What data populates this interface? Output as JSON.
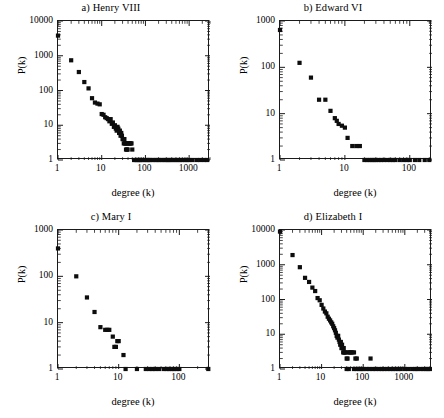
{
  "figure": {
    "panel_count": 4,
    "axis_labels": {
      "x": "degree (k)",
      "y": "P(k)"
    }
  },
  "chart_data": [
    {
      "type": "scatter",
      "title": "a) Henry VIII",
      "xlabel": "degree (k)",
      "ylabel": "P(k)",
      "xscale": "log",
      "yscale": "log",
      "xlim": [
        1,
        3000
      ],
      "ylim": [
        1,
        10000
      ],
      "xticks": [
        1,
        10,
        100,
        1000
      ],
      "xtick_labels": [
        "1",
        "10",
        "100",
        "1000"
      ],
      "yticks": [
        1,
        10,
        100,
        1000,
        10000
      ],
      "ytick_labels": [
        "1",
        "10",
        "100",
        "1000",
        "10000"
      ],
      "grid": false,
      "legend": "none",
      "x": [
        1,
        2,
        3,
        4,
        5,
        6,
        7,
        8,
        9,
        10,
        11,
        12,
        13,
        14,
        15,
        16,
        17,
        18,
        19,
        20,
        21,
        22,
        23,
        24,
        25,
        26,
        27,
        28,
        29,
        30,
        31,
        32,
        33,
        34,
        35,
        36,
        37,
        38,
        39,
        40,
        42,
        44,
        46,
        48,
        50,
        55,
        60,
        65,
        70,
        75,
        80,
        90,
        100,
        110,
        120,
        130,
        150,
        170,
        190,
        210,
        240,
        270,
        300,
        330,
        360,
        400,
        450,
        500,
        560,
        620,
        700,
        800,
        900,
        1000,
        1200,
        1500,
        1800,
        2200,
        2600
      ],
      "y": [
        3800,
        740,
        340,
        175,
        115,
        60,
        45,
        42,
        40,
        21,
        20,
        17,
        16,
        15,
        13,
        15,
        11,
        12,
        9,
        10,
        8,
        7,
        9,
        8,
        6,
        7,
        5,
        6,
        5,
        4,
        4,
        3,
        4,
        3,
        3,
        2,
        3,
        2,
        2,
        3,
        3,
        3,
        3,
        3,
        2,
        1,
        1,
        1,
        1,
        1,
        1,
        1,
        1,
        1,
        1,
        1,
        1,
        1,
        1,
        1,
        1,
        1,
        1,
        1,
        1,
        1,
        1,
        1,
        1,
        1,
        1,
        1,
        1,
        1,
        1,
        1,
        1,
        1,
        1
      ]
    },
    {
      "type": "scatter",
      "title": "b) Edward VI",
      "xlabel": "degree (k)",
      "ylabel": "P(k)",
      "xscale": "log",
      "yscale": "log",
      "xlim": [
        1,
        220
      ],
      "ylim": [
        1,
        1000
      ],
      "xticks": [
        1,
        10,
        100
      ],
      "xtick_labels": [
        "1",
        "10",
        "100"
      ],
      "yticks": [
        1,
        10,
        100,
        1000
      ],
      "ytick_labels": [
        "1",
        "10",
        "100",
        "1000"
      ],
      "grid": false,
      "legend": "none",
      "x": [
        1,
        2,
        3,
        4,
        5,
        6,
        7,
        7.5,
        8,
        9,
        10,
        11,
        13,
        15,
        17,
        20,
        22,
        24,
        26,
        28,
        30,
        33,
        36,
        40,
        45,
        50,
        55,
        60,
        70,
        80,
        90,
        100,
        120,
        140,
        170,
        200
      ],
      "y": [
        640,
        125,
        60,
        20,
        20,
        11.5,
        8,
        7,
        6,
        5.5,
        5,
        3,
        2,
        2,
        2,
        1,
        1,
        1,
        1,
        1,
        1,
        1,
        1,
        1,
        1,
        1,
        1,
        1,
        1,
        1,
        1,
        1,
        1,
        1,
        1,
        1
      ]
    },
    {
      "type": "scatter",
      "title": "c) Mary I",
      "xlabel": "degree (k)",
      "ylabel": "P(k)",
      "xscale": "log",
      "yscale": "log",
      "xlim": [
        1,
        320
      ],
      "ylim": [
        1,
        1000
      ],
      "xticks": [
        1,
        10,
        100
      ],
      "xtick_labels": [
        "1",
        "10",
        "100"
      ],
      "yticks": [
        1,
        10,
        100,
        1000
      ],
      "ytick_labels": [
        "1",
        "10",
        "100",
        "1000"
      ],
      "grid": false,
      "legend": "none",
      "x": [
        1,
        2,
        3,
        4,
        5,
        6,
        6.5,
        7,
        8,
        8.5,
        9,
        9.5,
        10,
        12,
        13,
        20,
        28,
        32,
        36,
        40,
        46,
        55,
        62,
        68,
        75,
        82,
        90,
        100,
        300
      ],
      "y": [
        400,
        100,
        35,
        17,
        8,
        7,
        7,
        7,
        5,
        3,
        3,
        4,
        4,
        2,
        1,
        1,
        1,
        1,
        1,
        1,
        1,
        1,
        1,
        1,
        1,
        1,
        1,
        1,
        1
      ]
    },
    {
      "type": "scatter",
      "title": "d) Elizabeth I",
      "xlabel": "degree (k)",
      "ylabel": "P(k)",
      "xscale": "log",
      "yscale": "log",
      "xlim": [
        1,
        4500
      ],
      "ylim": [
        1,
        10000
      ],
      "xticks": [
        1,
        10,
        100,
        1000
      ],
      "xtick_labels": [
        "1",
        "10",
        "100",
        "1000"
      ],
      "yticks": [
        1,
        10,
        100,
        1000,
        10000
      ],
      "ytick_labels": [
        "1",
        "10",
        "100",
        "1000",
        "10000"
      ],
      "grid": false,
      "legend": "none",
      "x": [
        1,
        2,
        3,
        4,
        5,
        6,
        7,
        8,
        9,
        10,
        11,
        12,
        13,
        14,
        15,
        16,
        17,
        18,
        19,
        20,
        21,
        22,
        23,
        24,
        25,
        26,
        27,
        28,
        29,
        30,
        31,
        32,
        33,
        34,
        35,
        36,
        38,
        40,
        42,
        45,
        48,
        50,
        55,
        60,
        65,
        70,
        150,
        40,
        45,
        60,
        70,
        80,
        90,
        100,
        120,
        140,
        170,
        200,
        240,
        280,
        320,
        380,
        450,
        520,
        600,
        700,
        800,
        1000,
        1200,
        1500,
        1800,
        2000,
        2400,
        2800,
        3200,
        3600,
        4000
      ],
      "y": [
        9000,
        1900,
        850,
        420,
        320,
        220,
        175,
        110,
        95,
        70,
        55,
        45,
        40,
        32,
        28,
        25,
        22,
        20,
        17,
        15,
        13,
        11,
        9,
        8,
        9,
        7,
        6,
        5,
        6,
        4,
        5,
        4,
        3,
        4,
        3,
        3,
        3,
        2,
        2,
        3,
        3,
        3,
        3,
        3,
        2,
        2,
        2,
        1,
        1,
        1,
        1,
        1,
        1,
        1,
        1,
        1,
        1,
        1,
        1,
        1,
        1,
        1,
        1,
        1,
        1,
        1,
        1,
        1,
        1,
        1,
        1,
        1,
        1,
        1,
        1,
        1,
        1
      ]
    }
  ]
}
